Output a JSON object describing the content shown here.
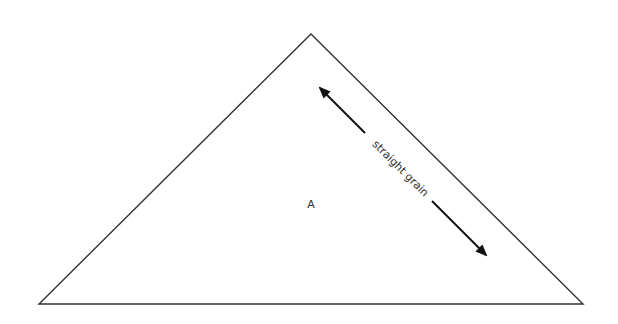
{
  "diagram": {
    "type": "sewing-pattern-piece",
    "shape": "triangle",
    "piece_label": "A",
    "grainline_label": "straight grain",
    "colors": {
      "outline": "#333333",
      "arrow": "#111111",
      "background": "#ffffff"
    }
  }
}
